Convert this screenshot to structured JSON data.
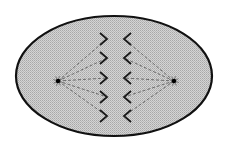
{
  "diagram": {
    "type": "cell-division-anaphase",
    "colors": {
      "background": "#ffffff",
      "cell_fill": "#c8c8c8",
      "cell_stroke": "#111111",
      "chromosome": "#1a1a1a",
      "spindle": "#6a6a6a",
      "pole": "#000000"
    },
    "cell": {
      "cx": 114,
      "cy": 76,
      "rx": 98,
      "ry": 60
    },
    "poles": [
      {
        "name": "left-centrosome",
        "x": 58,
        "y": 81
      },
      {
        "name": "right-centrosome",
        "x": 174,
        "y": 81
      }
    ],
    "chromosomes_left": [
      {
        "tip_x": 107,
        "tip_y": 39
      },
      {
        "tip_x": 107,
        "tip_y": 58
      },
      {
        "tip_x": 107,
        "tip_y": 78
      },
      {
        "tip_x": 107,
        "tip_y": 97
      },
      {
        "tip_x": 107,
        "tip_y": 116
      }
    ],
    "chromosomes_right": [
      {
        "tip_x": 124,
        "tip_y": 39
      },
      {
        "tip_x": 124,
        "tip_y": 58
      },
      {
        "tip_x": 124,
        "tip_y": 78
      },
      {
        "tip_x": 124,
        "tip_y": 97
      },
      {
        "tip_x": 124,
        "tip_y": 116
      }
    ]
  }
}
